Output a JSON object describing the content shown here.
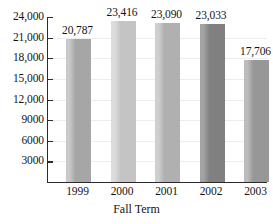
{
  "chart_data": {
    "type": "bar",
    "title": "",
    "subtitle": "",
    "xlabel": "Fall Term",
    "ylabel": "",
    "categories": [
      "1999",
      "2000",
      "2001",
      "2002",
      "2003"
    ],
    "values": [
      20787,
      23416,
      23090,
      23033,
      17706
    ],
    "value_labels": [
      "20,787",
      "23,416",
      "23,090",
      "23,033",
      "17,706"
    ],
    "bar_colors": [
      "#a6a6a6",
      "#c4c4c4",
      "#b0b0b0",
      "#808080",
      "#979797"
    ],
    "bar_highlight_colors": [
      "#c9c9c9",
      "#dcdcdc",
      "#cfcfcf",
      "#a3a3a3",
      "#bcbcbc"
    ],
    "ylim": [
      0,
      24000
    ],
    "ytick_values": [
      3000,
      6000,
      9000,
      12000,
      15000,
      18000,
      21000,
      24000
    ],
    "ytick_labels": [
      "3000",
      "6000",
      "9000",
      "12,000",
      "15,000",
      "18,000",
      "21,000",
      "24,000"
    ],
    "grid": true,
    "grid_color": "#ededed",
    "axis_color": "#2b2b2b",
    "legend": false,
    "legend_position": "none",
    "background": "#ffffff"
  }
}
